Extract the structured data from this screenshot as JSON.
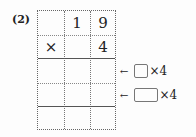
{
  "problem": {
    "number_label": "(2)",
    "rows": [
      [
        "",
        "1",
        "9"
      ],
      [
        "×",
        "",
        "4"
      ],
      [
        "",
        "",
        ""
      ],
      [
        "",
        "",
        ""
      ],
      [
        "",
        "",
        ""
      ]
    ],
    "hints": [
      {
        "arrow": "←",
        "suffix": "×4"
      },
      {
        "arrow": "←",
        "suffix": "×4"
      }
    ]
  }
}
